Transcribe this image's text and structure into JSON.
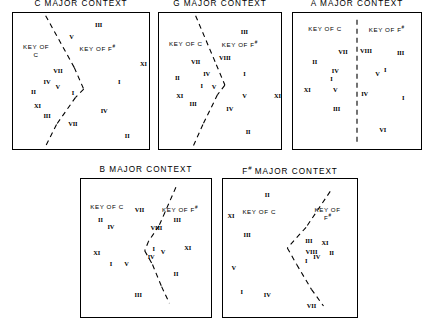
{
  "figure": {
    "width": 433,
    "height": 330,
    "background": "#ffffff",
    "ink": "#000000",
    "panel_count": 5
  },
  "chart_data": {
    "type": "scatter",
    "xlabel": "",
    "ylabel": "",
    "xlim": [
      0,
      100
    ],
    "ylim": [
      0,
      100
    ],
    "grid": false,
    "legend": null,
    "note": "Each panel is a bounded 2-D space containing labelled Roman-numeral points separated into two key regions by a dashed boundary line.",
    "panels": [
      {
        "id": "c-major",
        "title": "C MAJOR CONTEXT",
        "title_sup": "",
        "region_labels": [
          {
            "name": "key-of-c-label",
            "text": "KEY OF",
            "text2": "C",
            "sup": "",
            "x": 17,
            "y": 28
          },
          {
            "name": "key-of-f-sharp-label",
            "text": "KEY OF F",
            "text2": "",
            "sup": "#",
            "x": 62,
            "y": 26
          }
        ],
        "divider": {
          "type": "polyline",
          "points": [
            [
              24,
              2
            ],
            [
              45,
              40
            ],
            [
              52,
              56
            ],
            [
              46,
              62
            ],
            [
              32,
              82
            ],
            [
              24,
              98
            ]
          ]
        },
        "points": [
          {
            "label": "III",
            "x": 63,
            "y": 8
          },
          {
            "label": "V",
            "x": 43,
            "y": 17
          },
          {
            "label": "XI",
            "x": 96,
            "y": 37
          },
          {
            "label": "VII",
            "x": 33,
            "y": 42
          },
          {
            "label": "IV",
            "x": 25,
            "y": 50
          },
          {
            "label": "I",
            "x": 78,
            "y": 50
          },
          {
            "label": "V",
            "x": 33,
            "y": 54
          },
          {
            "label": "II",
            "x": 15,
            "y": 57
          },
          {
            "label": "I",
            "x": 44,
            "y": 58
          },
          {
            "label": "XI",
            "x": 18,
            "y": 68
          },
          {
            "label": "III",
            "x": 25,
            "y": 75
          },
          {
            "label": "IV",
            "x": 67,
            "y": 71
          },
          {
            "label": "VII",
            "x": 44,
            "y": 81
          },
          {
            "label": "II",
            "x": 84,
            "y": 90
          }
        ]
      },
      {
        "id": "g-major",
        "title": "G MAJOR CONTEXT",
        "title_sup": "",
        "region_labels": [
          {
            "name": "key-of-c-label",
            "text": "KEY OF C",
            "text2": "",
            "sup": "",
            "x": 22,
            "y": 23
          },
          {
            "name": "key-of-f-sharp-label",
            "text": "KEY OF F",
            "text2": "",
            "sup": "#",
            "x": 66,
            "y": 23
          }
        ],
        "divider": {
          "type": "polyline",
          "points": [
            [
              30,
              2
            ],
            [
              47,
              38
            ],
            [
              54,
              53
            ],
            [
              48,
              60
            ],
            [
              36,
              82
            ],
            [
              28,
              98
            ]
          ]
        },
        "points": [
          {
            "label": "III",
            "x": 70,
            "y": 13
          },
          {
            "label": "VIII",
            "x": 54,
            "y": 32
          },
          {
            "label": "VII",
            "x": 30,
            "y": 35
          },
          {
            "label": "IV",
            "x": 39,
            "y": 44
          },
          {
            "label": "I",
            "x": 70,
            "y": 44
          },
          {
            "label": "II",
            "x": 15,
            "y": 47
          },
          {
            "label": "I",
            "x": 35,
            "y": 53
          },
          {
            "label": "V",
            "x": 45,
            "y": 54
          },
          {
            "label": "XI",
            "x": 17,
            "y": 60
          },
          {
            "label": "V",
            "x": 70,
            "y": 60
          },
          {
            "label": "XI",
            "x": 97,
            "y": 60
          },
          {
            "label": "III",
            "x": 28,
            "y": 66
          },
          {
            "label": "IV",
            "x": 58,
            "y": 70
          },
          {
            "label": "II",
            "x": 73,
            "y": 87
          }
        ]
      },
      {
        "id": "a-major",
        "title": "A MAJOR CONTEXT",
        "title_sup": "",
        "region_labels": [
          {
            "name": "key-of-c-label",
            "text": "KEY OF C",
            "text2": "",
            "sup": "",
            "x": 25,
            "y": 12
          },
          {
            "name": "key-of-f-sharp-label",
            "text": "KEY OF F",
            "text2": "",
            "sup": "#",
            "x": 73,
            "y": 12
          }
        ],
        "divider": {
          "type": "vertical",
          "x": 50,
          "y1": 5,
          "y2": 97
        },
        "points": [
          {
            "label": "VII",
            "x": 39,
            "y": 28
          },
          {
            "label": "VIII",
            "x": 57,
            "y": 27
          },
          {
            "label": "III",
            "x": 84,
            "y": 29
          },
          {
            "label": "II",
            "x": 17,
            "y": 35
          },
          {
            "label": "IV",
            "x": 33,
            "y": 42
          },
          {
            "label": "V",
            "x": 66,
            "y": 44
          },
          {
            "label": "I",
            "x": 72,
            "y": 41
          },
          {
            "label": "I",
            "x": 30,
            "y": 48
          },
          {
            "label": "XI",
            "x": 11,
            "y": 56
          },
          {
            "label": "V",
            "x": 33,
            "y": 56
          },
          {
            "label": "IV",
            "x": 56,
            "y": 59
          },
          {
            "label": "I",
            "x": 86,
            "y": 62
          },
          {
            "label": "III",
            "x": 34,
            "y": 70
          },
          {
            "label": "VI",
            "x": 70,
            "y": 85
          }
        ]
      },
      {
        "id": "b-major",
        "title": "B MAJOR CONTEXT",
        "title_sup": "",
        "region_labels": [
          {
            "name": "key-of-c-label",
            "text": "KEY OF C",
            "text2": "",
            "sup": "",
            "x": 20,
            "y": 20
          },
          {
            "name": "key-of-f-sharp-label",
            "text": "KEY OF F",
            "text2": "",
            "sup": "#",
            "x": 76,
            "y": 22
          }
        ],
        "divider": {
          "type": "polyline",
          "points": [
            [
              73,
              6
            ],
            [
              60,
              34
            ],
            [
              52,
              45
            ],
            [
              49,
              52
            ],
            [
              55,
              62
            ],
            [
              62,
              78
            ],
            [
              68,
              90
            ]
          ]
        },
        "points": [
          {
            "label": "VII",
            "x": 45,
            "y": 22
          },
          {
            "label": "II",
            "x": 15,
            "y": 29
          },
          {
            "label": "III",
            "x": 74,
            "y": 29
          },
          {
            "label": "IV",
            "x": 23,
            "y": 34
          },
          {
            "label": "VIII",
            "x": 58,
            "y": 35
          },
          {
            "label": "I",
            "x": 56,
            "y": 50
          },
          {
            "label": "V",
            "x": 63,
            "y": 52
          },
          {
            "label": "XI",
            "x": 82,
            "y": 49
          },
          {
            "label": "XI",
            "x": 12,
            "y": 53
          },
          {
            "label": "IV",
            "x": 54,
            "y": 56
          },
          {
            "label": "I",
            "x": 23,
            "y": 61
          },
          {
            "label": "V",
            "x": 35,
            "y": 61
          },
          {
            "label": "II",
            "x": 73,
            "y": 68
          },
          {
            "label": "III",
            "x": 44,
            "y": 83
          }
        ]
      },
      {
        "id": "f-sharp-major",
        "title": "MAJOR CONTEXT",
        "title_sup": "F#",
        "region_labels": [
          {
            "name": "key-of-c-label",
            "text": "KEY OF C",
            "text2": "",
            "sup": "",
            "x": 27,
            "y": 24
          },
          {
            "name": "key-of-f-sharp-label",
            "text": "KEY OF",
            "text2": "F",
            "sup": "#",
            "x": 78,
            "y": 25
          }
        ],
        "divider": {
          "type": "polyline",
          "points": [
            [
              80,
              9
            ],
            [
              62,
              35
            ],
            [
              48,
              50
            ],
            [
              55,
              62
            ],
            [
              66,
              80
            ],
            [
              75,
              92
            ]
          ]
        },
        "points": [
          {
            "label": "II",
            "x": 33,
            "y": 11
          },
          {
            "label": "XI",
            "x": 6,
            "y": 26
          },
          {
            "label": "III",
            "x": 18,
            "y": 40
          },
          {
            "label": "III",
            "x": 64,
            "y": 44
          },
          {
            "label": "XI",
            "x": 76,
            "y": 46
          },
          {
            "label": "VIII",
            "x": 66,
            "y": 52
          },
          {
            "label": "II",
            "x": 81,
            "y": 53
          },
          {
            "label": "IV",
            "x": 70,
            "y": 56
          },
          {
            "label": "I",
            "x": 62,
            "y": 59
          },
          {
            "label": "V",
            "x": 8,
            "y": 64
          },
          {
            "label": "I",
            "x": 14,
            "y": 81
          },
          {
            "label": "IV",
            "x": 33,
            "y": 83
          },
          {
            "label": "VII",
            "x": 66,
            "y": 91
          }
        ]
      }
    ]
  }
}
